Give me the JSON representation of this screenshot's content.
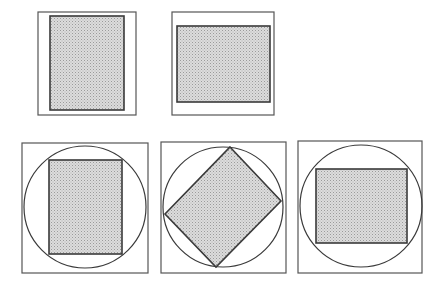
{
  "colors": {
    "background": "#ffffff",
    "stroke": "#3a3a3a",
    "frame_stroke": "#555555",
    "fill": "#d6d6d6",
    "dot": "#9a9a9a"
  },
  "figures": [
    {
      "id": "portrait-rectangle",
      "frame": {
        "x": 38,
        "y": 12,
        "w": 98,
        "h": 103
      },
      "shape": {
        "type": "rect",
        "x": 50,
        "y": 16,
        "w": 74,
        "h": 94
      }
    },
    {
      "id": "landscape-rectangle",
      "frame": {
        "x": 172,
        "y": 12,
        "w": 102,
        "h": 103
      },
      "shape": {
        "type": "rect",
        "x": 177,
        "y": 26,
        "w": 93,
        "h": 76
      }
    },
    {
      "id": "portrait-rectangle-in-circle",
      "frame": {
        "x": 22,
        "y": 143,
        "w": 126,
        "h": 130
      },
      "circle": {
        "cx": 85,
        "cy": 207,
        "r": 61
      },
      "shape": {
        "type": "rect",
        "x": 49,
        "y": 160,
        "w": 73,
        "h": 94
      }
    },
    {
      "id": "rotated-rectangle-in-circle",
      "frame": {
        "x": 161,
        "y": 142,
        "w": 125,
        "h": 131
      },
      "circle": {
        "cx": 223,
        "cy": 207,
        "r": 60
      },
      "shape": {
        "type": "polygon",
        "points": "230,147 281,201 216,267 165,214"
      }
    },
    {
      "id": "landscape-rectangle-in-circle",
      "frame": {
        "x": 298,
        "y": 141,
        "w": 124,
        "h": 132
      },
      "circle": {
        "cx": 361,
        "cy": 206,
        "r": 61
      },
      "shape": {
        "type": "rect",
        "x": 316,
        "y": 169,
        "w": 91,
        "h": 74
      }
    }
  ]
}
